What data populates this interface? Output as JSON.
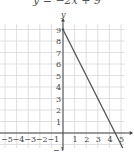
{
  "chart_data": {
    "type": "line",
    "title": "y = −2x + 9",
    "xlabel": "x",
    "ylabel": "y",
    "xlim": [
      -5,
      5
    ],
    "ylim": [
      -1,
      9
    ],
    "grid": true,
    "x_ticks": [
      "−5",
      "−4",
      "−3",
      "−2",
      "−1",
      "1",
      "2",
      "3",
      "4",
      "5"
    ],
    "y_ticks": [
      "−1",
      "1",
      "2",
      "3",
      "4",
      "5",
      "6",
      "7",
      "8",
      "9"
    ],
    "series": [
      {
        "name": "y = −2x + 9",
        "points": [
          [
            0,
            9
          ],
          [
            5,
            -1
          ]
        ],
        "color": "#555555"
      }
    ]
  },
  "colors": {
    "grid": "#d8d8d8",
    "axis": "#444444",
    "line": "#555555"
  }
}
